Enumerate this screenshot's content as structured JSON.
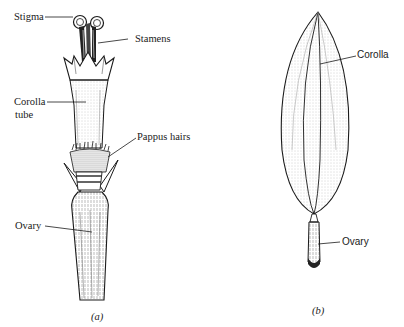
{
  "figure_a": {
    "caption": "(a)",
    "labels": {
      "stigma": "Stigma",
      "stamens": "Stamens",
      "corolla_tube_line1": "Corolla",
      "corolla_tube_line2": "tube",
      "pappus_hairs": "Pappus hairs",
      "ovary": "Ovary"
    }
  },
  "figure_b": {
    "caption": "(b)",
    "labels": {
      "corolla": "Corolla",
      "ovary": "Ovary"
    }
  },
  "colors": {
    "ink": "#1a1a1a",
    "shading": "#8a8a8a",
    "background": "#ffffff"
  }
}
